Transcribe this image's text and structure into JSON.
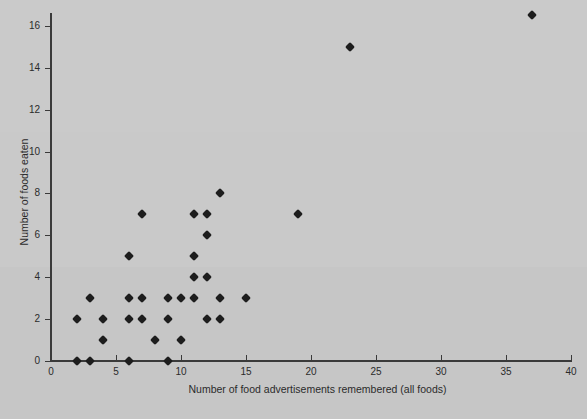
{
  "chart_data": {
    "type": "scatter",
    "title": "",
    "xlabel": "Number of food advertisements remembered (all foods)",
    "ylabel": "Number of foods eaten",
    "xlim": [
      0,
      40
    ],
    "ylim": [
      0,
      16
    ],
    "xticks": [
      0,
      5,
      10,
      15,
      20,
      25,
      30,
      35,
      40
    ],
    "yticks": [
      0,
      2,
      4,
      6,
      8,
      10,
      12,
      14,
      16
    ],
    "xtick_labels": [
      "0",
      "5",
      "10",
      "15",
      "20",
      "25",
      "30",
      "35",
      "40"
    ],
    "ytick_labels": [
      "0",
      "2",
      "4",
      "6",
      "8",
      "10",
      "12",
      "14",
      "16"
    ],
    "grid": false,
    "legend": null,
    "marker": "diamond",
    "marker_color": "#1d1d1d",
    "points": [
      {
        "x": 2,
        "y": 0
      },
      {
        "x": 3,
        "y": 0
      },
      {
        "x": 6,
        "y": 0
      },
      {
        "x": 9,
        "y": 0
      },
      {
        "x": 4,
        "y": 1
      },
      {
        "x": 8,
        "y": 1
      },
      {
        "x": 10,
        "y": 1
      },
      {
        "x": 2,
        "y": 2
      },
      {
        "x": 4,
        "y": 2
      },
      {
        "x": 6,
        "y": 2
      },
      {
        "x": 7,
        "y": 2
      },
      {
        "x": 9,
        "y": 2
      },
      {
        "x": 12,
        "y": 2
      },
      {
        "x": 13,
        "y": 2
      },
      {
        "x": 3,
        "y": 3
      },
      {
        "x": 6,
        "y": 3
      },
      {
        "x": 7,
        "y": 3
      },
      {
        "x": 9,
        "y": 3
      },
      {
        "x": 10,
        "y": 3
      },
      {
        "x": 11,
        "y": 3
      },
      {
        "x": 13,
        "y": 3
      },
      {
        "x": 15,
        "y": 3
      },
      {
        "x": 11,
        "y": 4
      },
      {
        "x": 12,
        "y": 4
      },
      {
        "x": 6,
        "y": 5
      },
      {
        "x": 11,
        "y": 5
      },
      {
        "x": 12,
        "y": 6
      },
      {
        "x": 7,
        "y": 7
      },
      {
        "x": 11,
        "y": 7
      },
      {
        "x": 12,
        "y": 7
      },
      {
        "x": 19,
        "y": 7
      },
      {
        "x": 13,
        "y": 8
      },
      {
        "x": 23,
        "y": 15
      },
      {
        "x": 37,
        "y": 16.5
      }
    ]
  },
  "colors": {
    "background": "#c9c9c9",
    "axis": "#3a3a3a",
    "text": "#2b2b2b",
    "marker": "#1d1d1d"
  }
}
